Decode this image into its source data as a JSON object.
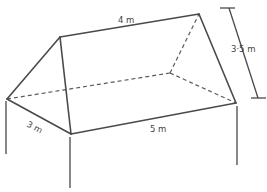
{
  "figure": {
    "labels": {
      "ridge_length": "4 m",
      "base_length": "5 m",
      "base_width": "3 m",
      "height": "3·5 m"
    },
    "colors": {
      "line": "#4a4a4a",
      "background": "#ffffff"
    }
  }
}
